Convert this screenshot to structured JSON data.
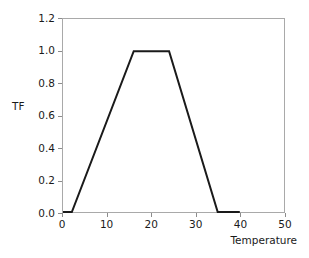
{
  "chart_data": {
    "type": "line",
    "title": "",
    "subtitle": "",
    "xlabel": "Temperature",
    "ylabel": "TF",
    "xlim": [
      0,
      50
    ],
    "ylim": [
      0,
      1.2
    ],
    "grid": false,
    "legend": false,
    "legend_position": "none",
    "xticks": [
      0,
      10,
      20,
      30,
      40,
      50
    ],
    "xtick_labels": [
      "0",
      "10",
      "20",
      "30",
      "40",
      "50"
    ],
    "yticks": [
      0.0,
      0.2,
      0.4,
      0.6,
      0.8,
      1.0,
      1.2
    ],
    "ytick_labels": [
      "0.0",
      "0.2",
      "0.4",
      "0.6",
      "0.8",
      "1.0",
      "1.2"
    ],
    "series": [
      {
        "name": "TF",
        "color": "#1a1a1a",
        "line_width": 2,
        "x": [
          0,
          2,
          16,
          24,
          35,
          40
        ],
        "y": [
          0.0,
          0.0,
          1.0,
          1.0,
          0.0,
          0.0
        ]
      }
    ],
    "annotations": []
  },
  "frame": {
    "border_color": "#a9a9a9",
    "background": "#ffffff"
  }
}
